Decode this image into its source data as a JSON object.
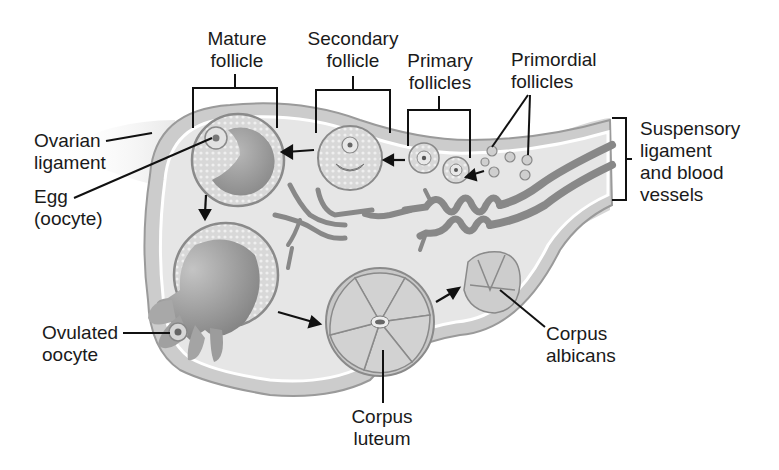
{
  "diagram": {
    "labels": {
      "mature_follicle": [
        "Mature",
        "follicle"
      ],
      "secondary_follicle": [
        "Secondary",
        "follicle"
      ],
      "primary_follicles": [
        "Primary",
        "follicles"
      ],
      "primordial_follicles": [
        "Primordial",
        "follicles"
      ],
      "suspensory_ligament": [
        "Suspensory",
        "ligament",
        "and blood",
        "vessels"
      ],
      "ovarian_ligament": [
        "Ovarian",
        "ligament"
      ],
      "egg": [
        "Egg",
        "(oocyte)"
      ],
      "ovulated_oocyte": [
        "Ovulated",
        "oocyte"
      ],
      "corpus_luteum": [
        "Corpus",
        "luteum"
      ],
      "corpus_albicans": [
        "Corpus",
        "albicans"
      ]
    },
    "colors": {
      "tissue_fill": "#e4e4e4",
      "tissue_edge": "#9a9a9a",
      "cortex_fill": "#d4d4d4",
      "follicle_fill": "#cfcfcf",
      "antrum_fill": "#9e9e9e",
      "vessel_fill": "#8c8c8c",
      "line": "#111111"
    }
  }
}
